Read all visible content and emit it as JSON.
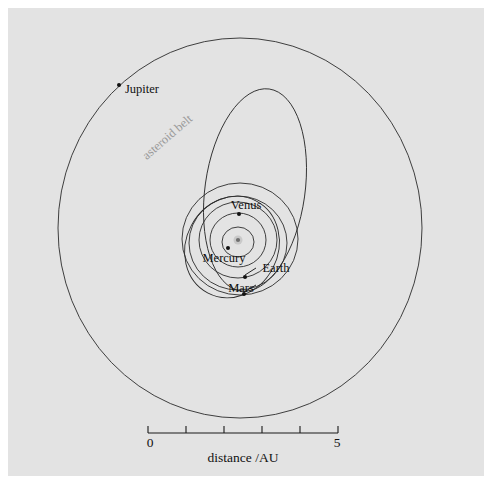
{
  "figure": {
    "background_color": "#ffffff",
    "panel_color": "#e3e3e3",
    "width": 492,
    "height": 491
  },
  "chart_data": {
    "type": "scatter",
    "title": "",
    "subtitle": "",
    "xlabel": "distance /AU",
    "ylabel": "",
    "grid": false,
    "legend": "none",
    "projection": "top-down orbital plane, Sun at centre",
    "scale": {
      "units": "AU",
      "ticks": [
        0,
        1,
        2,
        3,
        4,
        5
      ],
      "tick_labels_shown": [
        "0",
        "5"
      ],
      "label_min": "0",
      "label_max": "5",
      "axis_title": "distance /AU",
      "px_per_au": 38,
      "bar_start_px": 148,
      "bar_end_px": 338,
      "bar_y_px": 433
    },
    "center": {
      "name": "Sun",
      "x_px": 238,
      "y_px": 240,
      "label": ""
    },
    "annotations": [
      {
        "text": "asteroid belt",
        "color": "#9a9a9a",
        "x_px": 170,
        "y_px": 140,
        "rotation_deg": -41
      }
    ],
    "bodies": [
      {
        "name": "Mercury",
        "label": "Mercury",
        "semi_major_au": 0.39,
        "orbit_rx_px": 16,
        "orbit_ry_px": 15,
        "orbit_cx_px": 238,
        "orbit_cy_px": 242,
        "orbit_rotation_deg": 0,
        "marker_x_px": 228,
        "marker_y_px": 248,
        "label_x_px": 224,
        "label_y_px": 262,
        "label_anchor": "middle",
        "leader": false
      },
      {
        "name": "Venus",
        "label": "Venus",
        "semi_major_au": 0.72,
        "orbit_rx_px": 28,
        "orbit_ry_px": 27,
        "orbit_cx_px": 238,
        "orbit_cy_px": 240,
        "orbit_rotation_deg": 0,
        "marker_x_px": 239,
        "marker_y_px": 214,
        "label_x_px": 246,
        "label_y_px": 209,
        "label_anchor": "middle",
        "leader": false
      },
      {
        "name": "Earth",
        "label": "Earth",
        "semi_major_au": 1.0,
        "orbit_rx_px": 39,
        "orbit_ry_px": 38,
        "orbit_cx_px": 238,
        "orbit_cy_px": 240,
        "orbit_rotation_deg": 0,
        "marker_x_px": 245,
        "marker_y_px": 277,
        "label_x_px": 276,
        "label_y_px": 272,
        "label_anchor": "middle",
        "leader": true,
        "leader_x1_px": 245,
        "leader_y1_px": 275,
        "leader_x2_px": 256,
        "leader_y2_px": 268
      },
      {
        "name": "Mars",
        "label": "Mars",
        "semi_major_au": 1.52,
        "orbit_rx_px": 58,
        "orbit_ry_px": 56,
        "orbit_cx_px": 240,
        "orbit_cy_px": 239,
        "orbit_rotation_deg": 0,
        "marker_x_px": 244,
        "marker_y_px": 294,
        "label_x_px": 241,
        "label_y_px": 292,
        "label_anchor": "middle",
        "leader": true,
        "leader_x1_px": 244,
        "leader_y1_px": 292,
        "leader_x2_px": 256,
        "leader_y2_px": 285
      },
      {
        "name": "Jupiter",
        "label": "Jupiter",
        "semi_major_au": 5.2,
        "orbit_rx_px": 182,
        "orbit_ry_px": 190,
        "orbit_cx_px": 240,
        "orbit_cy_px": 228,
        "orbit_rotation_deg": 0,
        "marker_x_px": 119,
        "marker_y_px": 85,
        "label_x_px": 142,
        "label_y_px": 93,
        "label_anchor": "middle",
        "leader": false
      }
    ],
    "extra_orbits": [
      {
        "name": "comet-orbit-outer",
        "cx_px": 255,
        "cy_px": 190,
        "rx_px": 50,
        "ry_px": 102,
        "rotation_deg": 8
      },
      {
        "name": "comet-orbit-inner-tilted",
        "cx_px": 232,
        "cy_px": 247,
        "rx_px": 46,
        "ry_px": 52,
        "rotation_deg": 28
      },
      {
        "name": "asteroid-orbit-a",
        "cx_px": 238,
        "cy_px": 243,
        "rx_px": 49,
        "ry_px": 47,
        "rotation_deg": 0
      }
    ]
  }
}
